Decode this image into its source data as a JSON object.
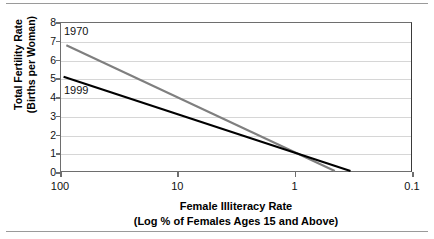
{
  "chart_data": {
    "type": "line",
    "title": "",
    "xlabel": "Female Illiteracy Rate",
    "xlabel_sub": "(Log % of Females Ages 15 and Above)",
    "ylabel": "Total Fertility Rate",
    "ylabel_sub": "(Births per Woman)",
    "x_scale": "log",
    "x_direction": "descending",
    "xlim": [
      100,
      0.1
    ],
    "ylim": [
      0,
      8
    ],
    "y_ticks": [
      8,
      7,
      6,
      5,
      4,
      3,
      2,
      1,
      0
    ],
    "x_ticks": [
      "100",
      "10",
      "1",
      "0.1"
    ],
    "x_tick_values": [
      100,
      10,
      1,
      0.1
    ],
    "grid": "horizontal",
    "legend_position": "inline-annotations",
    "series": [
      {
        "name": "1970",
        "color": "#7f7f7f",
        "points": [
          {
            "x": 90,
            "y": 6.8
          },
          {
            "x": 0.45,
            "y": 0
          }
        ]
      },
      {
        "name": "1999",
        "color": "#000000",
        "points": [
          {
            "x": 95,
            "y": 5.1
          },
          {
            "x": 0.33,
            "y": 0
          }
        ]
      }
    ],
    "annotations": [
      {
        "text": "1970",
        "series": "1970"
      },
      {
        "text": "1999",
        "series": "1999"
      }
    ]
  }
}
